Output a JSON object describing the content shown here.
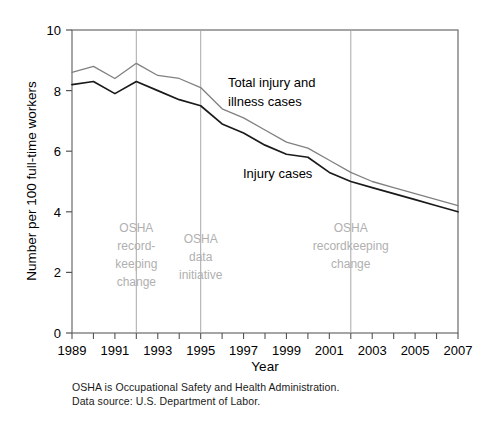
{
  "chart_data": {
    "type": "line",
    "title": "",
    "xlabel": "Year",
    "ylabel": "Number per 100 full-time workers",
    "xlim": [
      1989,
      2007
    ],
    "ylim": [
      0,
      10
    ],
    "ytick_values": [
      0,
      2,
      4,
      6,
      8,
      10
    ],
    "ytick_labels": [
      "0",
      "2",
      "4",
      "6",
      "8",
      "10"
    ],
    "xtick_values": [
      1989,
      1991,
      1993,
      1995,
      1997,
      1999,
      2001,
      2003,
      2005,
      2007
    ],
    "xtick_labels": [
      "1989",
      "1991",
      "1993",
      "1995",
      "1997",
      "1999",
      "2001",
      "2003",
      "2005",
      "2007"
    ],
    "grid": false,
    "legend_position": "inline-annotations",
    "x": [
      1989,
      1990,
      1991,
      1992,
      1993,
      1994,
      1995,
      1996,
      1997,
      1998,
      1999,
      2000,
      2001,
      2002,
      2003,
      2004,
      2005,
      2006,
      2007
    ],
    "series": [
      {
        "name": "Total injury and illness cases",
        "color": "#808080",
        "values": [
          8.6,
          8.8,
          8.4,
          8.9,
          8.5,
          8.4,
          8.1,
          7.4,
          7.1,
          6.7,
          6.3,
          6.1,
          5.7,
          5.3,
          5.0,
          4.8,
          4.6,
          4.4,
          4.2
        ]
      },
      {
        "name": "Injury cases",
        "color": "#1a1a1a",
        "values": [
          8.2,
          8.3,
          7.9,
          8.3,
          8.0,
          7.7,
          7.5,
          6.9,
          6.6,
          6.2,
          5.9,
          5.8,
          5.3,
          5.0,
          4.8,
          4.6,
          4.4,
          4.2,
          4.0
        ]
      }
    ],
    "series_label_annotations": [
      {
        "name": "total-series-label",
        "text_line1": "Total injury and",
        "text_line2": "illness cases"
      },
      {
        "name": "injury-series-label",
        "text_line1": "Injury cases",
        "text_line2": ""
      }
    ],
    "event_markers": [
      {
        "id": "osha-recordkeeping-change-1992",
        "year": 1992,
        "lines": [
          "OSHA",
          "record-",
          "keeping",
          "change"
        ],
        "color": "#b0b0b0"
      },
      {
        "id": "osha-data-initiative-1995",
        "year": 1995,
        "lines": [
          "OSHA",
          "data",
          "initiative"
        ],
        "color": "#b0b0b0"
      },
      {
        "id": "osha-recordkeeping-change-2002",
        "year": 2002,
        "lines": [
          "OSHA",
          "recordkeeping",
          "change"
        ],
        "color": "#b0b0b0"
      }
    ]
  },
  "footnotes": {
    "line1": "OSHA is Occupational Safety and Health Administration.",
    "line2": "Data source: U.S. Department of Labor."
  },
  "colors": {
    "total_series": "#808080",
    "injury_series": "#1a1a1a",
    "annotation": "#b0b0b0",
    "axis": "#555555",
    "background": "#ffffff"
  }
}
